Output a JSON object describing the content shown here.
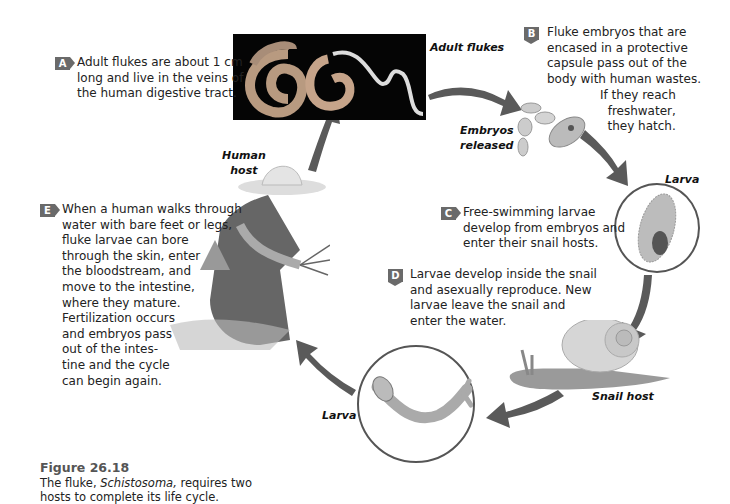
{
  "figure": {
    "number": "Figure 26.18",
    "caption_pre": "The fluke, ",
    "caption_italic": "Schistosoma,",
    "caption_post": " requires two\nhosts to complete its life cycle."
  },
  "steps": [
    {
      "badge": "A",
      "text": "Adult flukes are about 1 cm\nlong and live in the veins of\nthe human digestive tract."
    },
    {
      "badge": "B",
      "text": "Fluke embryos that are\nencased in a protective\ncapsule pass out of the\nbody with human wastes.",
      "text_extra": "If they reach\nfreshwater,\nthey hatch."
    },
    {
      "badge": "C",
      "text": "Free-swimming larvae\ndevelop from embryos and\nenter their snail hosts."
    },
    {
      "badge": "D",
      "text": "Larvae develop inside the snail\nand asexually reproduce. New\nlarvae leave the snail and\nenter the water."
    },
    {
      "badge": "E",
      "text": "When a human walks through\nwater with bare feet or legs,\nfluke larvae can bore\nthrough the skin, enter\nthe bloodstream, and\nmove to the intestine,\nwhere they mature.\nFertilization occurs\nand embryos pass\nout of the intes-\ntine and the cycle\ncan begin again."
    }
  ],
  "labels": {
    "adult_flukes": "Adult flukes",
    "embryos_released": "Embryos\nreleased",
    "larva_top": "Larva",
    "snail_host": "Snail host",
    "larva_bottom": "Larva",
    "human_host": "Human\nhost"
  },
  "colors": {
    "arrow": "#5a5a5a",
    "badge": "#6a6a6a",
    "figure_title": "#555555"
  }
}
